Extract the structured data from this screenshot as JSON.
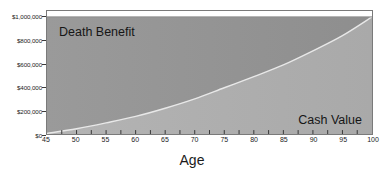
{
  "chart_data": {
    "type": "area",
    "title": "",
    "xlabel": "Age",
    "ylabel": "",
    "grid": false,
    "legend_position": "inside-plot",
    "stacked": true,
    "xlim": [
      45,
      100
    ],
    "ylim": [
      0,
      1000000
    ],
    "x_tick_labels": [
      "45",
      "50",
      "55",
      "60",
      "65",
      "70",
      "75",
      "80",
      "85",
      "90",
      "95",
      "100"
    ],
    "x_ticks": [
      45,
      50,
      55,
      60,
      65,
      70,
      75,
      80,
      85,
      90,
      95,
      100
    ],
    "x_minor_ticks": [
      47.5,
      52.5,
      57.5,
      62.5,
      67.5,
      72.5,
      77.5,
      82.5,
      87.5,
      92.5,
      97.5
    ],
    "y_tick_labels": [
      "$0",
      "$200,000",
      "$400,000",
      "$600,000",
      "$800,000",
      "$1,000,000"
    ],
    "y_ticks": [
      0,
      200000,
      400000,
      600000,
      800000,
      1000000
    ],
    "x": [
      45,
      50,
      55,
      60,
      65,
      70,
      75,
      80,
      85,
      90,
      95,
      100
    ],
    "series": [
      {
        "name": "Cash Value",
        "color": "#b0b0b0",
        "values": [
          5000,
          45000,
          95000,
          150000,
          220000,
          300000,
          395000,
          490000,
          590000,
          710000,
          840000,
          1000000
        ]
      },
      {
        "name": "Death Benefit",
        "color": "#949494",
        "values": [
          1000000,
          1000000,
          1000000,
          1000000,
          1000000,
          1000000,
          1000000,
          1000000,
          1000000,
          1000000,
          1000000,
          1000000
        ]
      }
    ],
    "annotations": [
      {
        "text": "Death Benefit",
        "region": "upper-left"
      },
      {
        "text": "Cash Value",
        "region": "lower-right"
      }
    ]
  },
  "colors": {
    "death_benefit_fill": "#949494",
    "cash_value_fill": "#b0b0b0",
    "curve_line": "#e8e8e8",
    "plot_border": "#7a7a7a",
    "axis_text": "#1b1b1b",
    "background": "#ffffff"
  },
  "labels": {
    "death_benefit": "Death Benefit",
    "cash_value": "Cash Value",
    "x_axis_title": "Age"
  }
}
